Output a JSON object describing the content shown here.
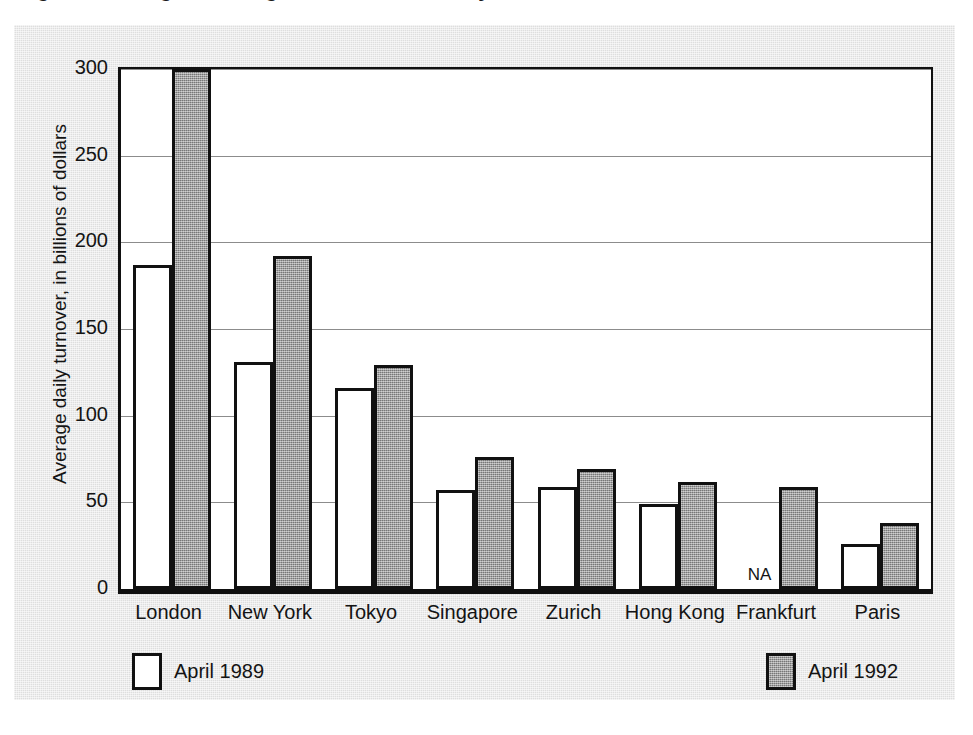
{
  "title": {
    "cropped_fragment": "Figure 1  Foreign exchange market turnover by financial centre"
  },
  "legend": {
    "position": "bottom",
    "items": [
      {
        "label": "April 1989",
        "key": "1989",
        "color": "#ffffff"
      },
      {
        "label": "April 1992",
        "key": "1992",
        "color": "#8f8f8f"
      }
    ]
  },
  "annotations": {
    "na_label": "NA"
  },
  "chart_data": {
    "type": "bar",
    "title": "",
    "xlabel": "",
    "ylabel": "Average daily turnover, in billions of dollars",
    "ylim": [
      0,
      300
    ],
    "yticks": [
      0,
      50,
      100,
      150,
      200,
      250,
      300
    ],
    "ytick_labels": [
      "0",
      "50",
      "100",
      "150",
      "200",
      "250",
      "300"
    ],
    "grid": true,
    "legend_position": "bottom",
    "categories": [
      "London",
      "New York",
      "Tokyo",
      "Singapore",
      "Zurich",
      "Hong Kong",
      "Frankfurt",
      "Paris"
    ],
    "series": [
      {
        "name": "April 1989",
        "color": "#ffffff",
        "values": [
          187,
          131,
          116,
          57,
          59,
          49,
          null,
          26
        ]
      },
      {
        "name": "April 1992",
        "color": "#8f8f8f",
        "values": [
          300,
          192,
          129,
          76,
          69,
          62,
          59,
          38
        ]
      }
    ],
    "missing_label": "NA",
    "missing_cells": [
      {
        "series": "April 1989",
        "category": "Frankfurt",
        "label": "NA"
      }
    ]
  }
}
